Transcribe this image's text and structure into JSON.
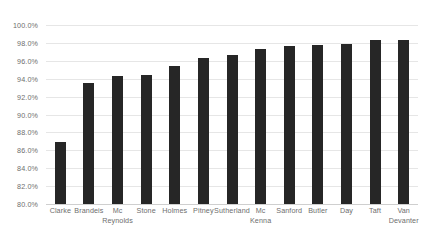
{
  "chart_data": {
    "type": "bar",
    "title": "",
    "subtitle": "",
    "xlabel": "",
    "ylabel": "",
    "ylim": [
      80.0,
      100.0
    ],
    "grid": true,
    "legend": false,
    "legend_position": "none",
    "value_format": "percent",
    "bar_color": "#262626",
    "gridline_color": "#e6e6e6",
    "axis_label_color": "#6e6e6e",
    "background_color": "#ffffff",
    "categories": [
      "Clarke",
      "Brandeis",
      "Mc Reynolds",
      "Stone",
      "Holmes",
      "Pitney",
      "Sutherland",
      "Mc Kenna",
      "Sanford",
      "Butler",
      "Day",
      "Taft",
      "Van Devanter"
    ],
    "category_lines": [
      [
        "Clarke"
      ],
      [
        "Brandeis"
      ],
      [
        "Mc",
        "Reynolds"
      ],
      [
        "Stone"
      ],
      [
        "Holmes"
      ],
      [
        "Pitney"
      ],
      [
        "Sutherland"
      ],
      [
        "Mc",
        "Kenna"
      ],
      [
        "Sanford"
      ],
      [
        "Butler"
      ],
      [
        "Day"
      ],
      [
        "Taft"
      ],
      [
        "Van",
        "Devanter"
      ]
    ],
    "values": [
      86.9,
      93.5,
      94.3,
      94.4,
      95.4,
      96.3,
      96.6,
      97.3,
      97.7,
      97.8,
      97.9,
      98.3,
      98.3
    ],
    "yticks": [
      80.0,
      82.0,
      84.0,
      86.0,
      88.0,
      90.0,
      92.0,
      94.0,
      96.0,
      98.0,
      100.0
    ],
    "ytick_labels": [
      "80.0%",
      "82.0%",
      "84.0%",
      "86.0%",
      "88.0%",
      "90.0%",
      "92.0%",
      "94.0%",
      "96.0%",
      "98.0%",
      "100.0%"
    ]
  }
}
